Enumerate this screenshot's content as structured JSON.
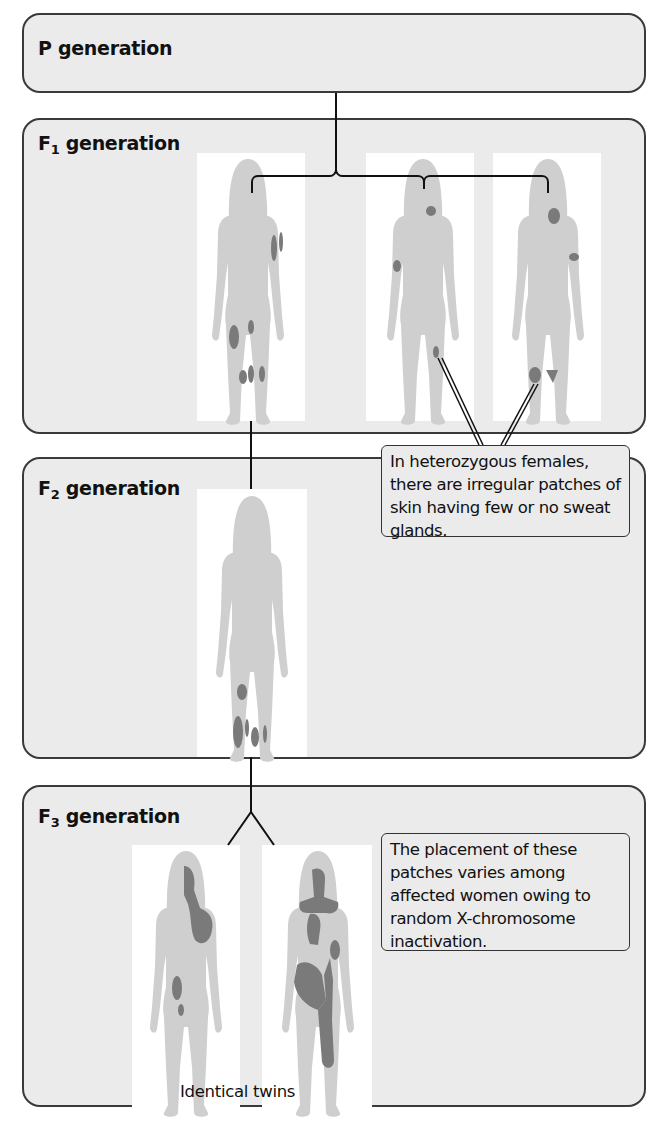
{
  "generations": {
    "p": {
      "label": "P generation"
    },
    "f1": {
      "label_main": "F",
      "label_sub": "1",
      "label_rest": " generation"
    },
    "f2": {
      "label_main": "F",
      "label_sub": "2",
      "label_rest": " generation"
    },
    "f3": {
      "label_main": "F",
      "label_sub": "3",
      "label_rest": " generation"
    }
  },
  "callouts": {
    "heterozygous": "In heterozygous females, there are irregular patches of skin having few or no sweat glands.",
    "placement": "The placement of these patches varies among affected women owing to random X-chromosome inactivation."
  },
  "captions": {
    "twins": "Identical twins"
  },
  "colors": {
    "panel_bg": "#ebebeb",
    "body_fill": "#cfcfcf",
    "patch_fill": "#7a7a7a",
    "border": "#3a3a3a"
  }
}
